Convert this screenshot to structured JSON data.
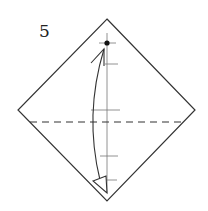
{
  "diagram": {
    "step_number": "5",
    "colors": {
      "paper_outline": "#333333",
      "crease": "#555555",
      "fold_line": "#333333",
      "arrow": "#333333",
      "background": "#ffffff"
    },
    "elements": {
      "paper": "square rotated 45 degrees (diamond)",
      "center_crease": "vertical",
      "reference_marks": 5,
      "fold_line": "valley fold (dashed), horizontal",
      "arrow": "curved fold arrow from bottom corner to top dot",
      "target_point": "dot near top corner"
    }
  }
}
